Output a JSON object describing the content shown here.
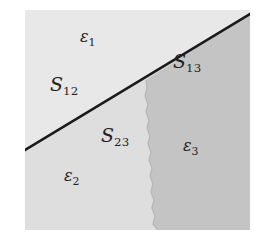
{
  "figure": {
    "kind": "phase-region-diagram",
    "background_color": "#ffffff",
    "frame": {
      "x": 25,
      "y": 10,
      "width": 225,
      "height": 220
    },
    "regions": [
      {
        "id": "epsilon-1",
        "label": "ε",
        "subscript": "1",
        "fill": "#e8e8e8",
        "label_x": 80,
        "label_y": 36
      },
      {
        "id": "epsilon-2",
        "label": "ε",
        "subscript": "2",
        "fill": "#dedede",
        "label_x": 64,
        "label_y": 172
      },
      {
        "id": "epsilon-3",
        "label": "ε",
        "subscript": "3",
        "fill": "#c4c4c4",
        "label_x": 183,
        "label_y": 142
      }
    ],
    "interfaces": [
      {
        "id": "S-12",
        "label": "S",
        "subscript": "12",
        "style": "straight-line",
        "stroke": "#1a1a1a",
        "label_x": 50,
        "label_y": 80
      },
      {
        "id": "S-13",
        "label": "S",
        "subscript": "13",
        "style": "straight-line",
        "stroke": "#1a1a1a",
        "label_x": 173,
        "label_y": 57
      },
      {
        "id": "S-23",
        "label": "S",
        "subscript": "23",
        "style": "jagged-line",
        "stroke": "#bdbdbd",
        "label_x": 101,
        "label_y": 130
      }
    ],
    "geometry": {
      "diagonal_start": {
        "x": 25,
        "y": 150
      },
      "diagonal_end": {
        "x": 250,
        "y": 14
      },
      "jagged_top": {
        "x": 146,
        "y": 80
      },
      "jagged_bottom": {
        "x": 158,
        "y": 230
      }
    }
  }
}
